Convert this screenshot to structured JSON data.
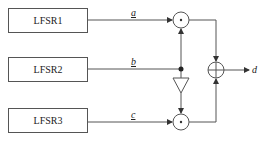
{
  "diagram": {
    "blocks": [
      {
        "id": "lfsr1",
        "label": "LFSR1"
      },
      {
        "id": "lfsr2",
        "label": "LFSR2"
      },
      {
        "id": "lfsr3",
        "label": "LFSR3"
      }
    ],
    "signals": {
      "a": "a",
      "b": "b",
      "c": "c",
      "d": "d"
    },
    "operators": [
      {
        "id": "and-top",
        "symbol": "·"
      },
      {
        "id": "and-bottom",
        "symbol": "·"
      },
      {
        "id": "xor",
        "symbol": "⊕"
      },
      {
        "id": "inverter",
        "symbol": "triangle"
      }
    ],
    "colors": {
      "line": "#555555",
      "text": "#222222"
    }
  }
}
